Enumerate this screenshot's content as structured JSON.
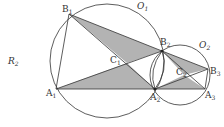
{
  "figure": {
    "side_label": "R",
    "side_label_sub": "2",
    "circles": [
      {
        "name": "O",
        "sub": "1",
        "cx": 107,
        "cy": 61,
        "r": 57
      },
      {
        "name": "O",
        "sub": "2",
        "cx": 180,
        "cy": 75,
        "r": 30
      },
      {
        "name": "lens",
        "cx": 160,
        "cy": 70,
        "r": 20
      }
    ],
    "points": {
      "B1": {
        "label": "B",
        "sub": "1",
        "x": 69,
        "y": 14
      },
      "A1": {
        "label": "A",
        "sub": "1",
        "x": 56,
        "y": 89
      },
      "A2": {
        "label": "A",
        "sub": "2",
        "x": 155,
        "y": 89
      },
      "B2": {
        "label": "B",
        "sub": "2",
        "x": 162,
        "y": 51
      },
      "C1": {
        "label": "C",
        "sub": "1",
        "x": 127,
        "y": 63
      },
      "B3": {
        "label": "B",
        "sub": "3",
        "x": 208,
        "y": 69
      },
      "A3": {
        "label": "A",
        "sub": "3",
        "x": 205,
        "y": 89
      },
      "C2": {
        "label": "C",
        "sub": "2",
        "x": 184,
        "y": 75
      }
    },
    "colors": {
      "stroke": "#333333",
      "shade": "#b0b0b0",
      "text": "#333333"
    }
  }
}
